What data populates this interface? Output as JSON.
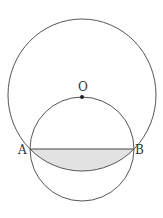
{
  "figure": {
    "labels": {
      "O": "O",
      "A": "A",
      "B": "B"
    },
    "points": {
      "O": [
        82,
        96
      ],
      "A": [
        30,
        149
      ],
      "B": [
        134,
        149
      ]
    },
    "large_circle": {
      "center": "O",
      "cx": 82,
      "cy": 95,
      "rx": 74,
      "ry": 76
    },
    "small_circle": {
      "cx": 82,
      "cy": 149,
      "r": 52
    },
    "shaded_region": "segment between chord AB and lower arc of large circle",
    "colors": {
      "stroke": "#555555",
      "shade": "#e2e2e2"
    }
  }
}
